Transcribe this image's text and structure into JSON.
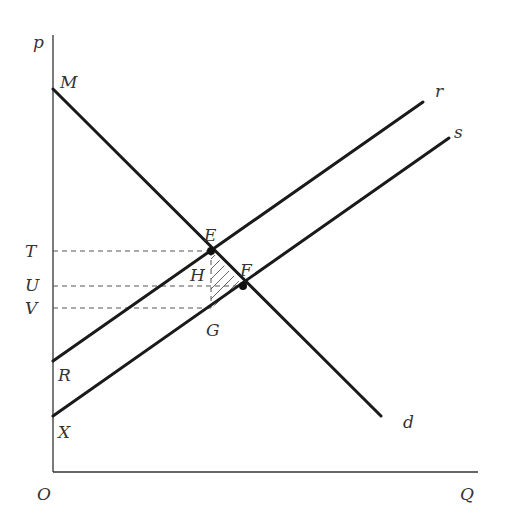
{
  "diagram": {
    "type": "supply-demand-tax-incidence",
    "axes": {
      "y_label": "p",
      "x_label": "Q",
      "origin_label": "O"
    },
    "curves": [
      {
        "id": "demand",
        "label": "d",
        "start_label": "M"
      },
      {
        "id": "supply_r",
        "label": "r",
        "start_label": "R"
      },
      {
        "id": "supply_s",
        "label": "s",
        "start_label": "X"
      }
    ],
    "points": [
      {
        "id": "E",
        "label": "E",
        "description": "intersection of d and r"
      },
      {
        "id": "F",
        "label": "F",
        "description": "intersection of d and s"
      },
      {
        "id": "G",
        "label": "G",
        "description": "point on s directly below E"
      },
      {
        "id": "H",
        "label": "H",
        "description": "hatched triangle E-F-G"
      }
    ],
    "price_levels": [
      {
        "label": "T",
        "at": "E"
      },
      {
        "label": "U",
        "at": "F"
      },
      {
        "label": "V",
        "at": "G"
      }
    ],
    "shaded_region": {
      "vertices": [
        "E",
        "F",
        "G"
      ],
      "label": "H",
      "style": "hatched"
    },
    "colors": {
      "lines": "#1a1a1a",
      "axis": "#333333",
      "dashes": "#555555"
    }
  }
}
